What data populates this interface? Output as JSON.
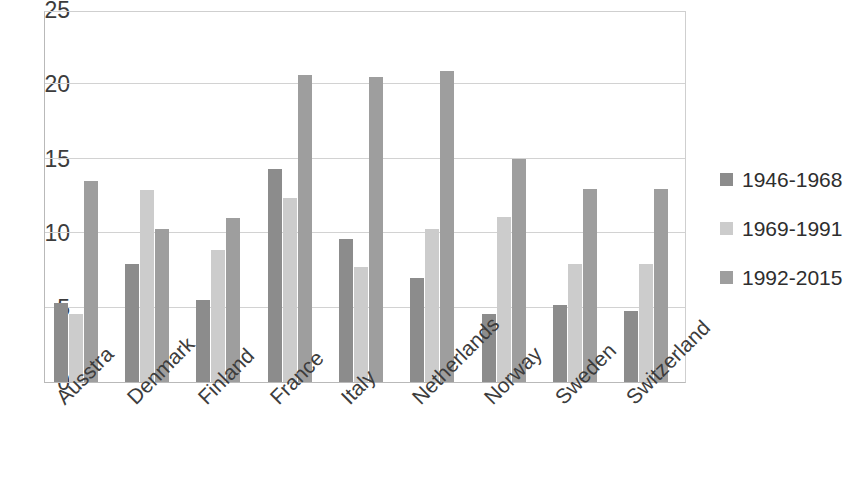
{
  "chart_data": {
    "type": "bar",
    "title": "",
    "subtitle": "",
    "xlabel": "",
    "ylabel": "",
    "ylim": [
      0,
      25
    ],
    "yticks": [
      0,
      5,
      10,
      15,
      20,
      25
    ],
    "ytick_labels": [
      "0",
      "5",
      "10",
      "15",
      "20",
      "25"
    ],
    "grid": true,
    "grid_axis": "y",
    "legend_position": "right",
    "bar_orientation": "vertical",
    "categories": [
      "Ausstra",
      "Denmark",
      "Finland",
      "France",
      "Italy",
      "Netherlands",
      "Norway",
      "Sweden",
      "Switzerland"
    ],
    "series": [
      {
        "name": "1946-1968",
        "color": "#8c8c8c",
        "values": [
          5.3,
          7.9,
          5.5,
          14.3,
          9.6,
          7.0,
          4.6,
          5.2,
          4.8
        ]
      },
      {
        "name": "1969-1991",
        "color": "#cccccc",
        "values": [
          4.6,
          12.9,
          8.9,
          12.4,
          7.7,
          10.3,
          11.1,
          7.9,
          7.9
        ]
      },
      {
        "name": "1992-2015",
        "color": "#9e9e9e",
        "values": [
          13.5,
          10.3,
          11.0,
          20.6,
          20.5,
          20.9,
          15.0,
          13.0,
          13.0
        ]
      }
    ]
  },
  "legend": {
    "items": [
      {
        "label": "1946-1968",
        "swatch_color": "#8c8c8c"
      },
      {
        "label": "1969-1991",
        "swatch_color": "#cccccc"
      },
      {
        "label": "1992-2015",
        "swatch_color": "#9e9e9e"
      }
    ]
  },
  "colors": {
    "background": "#ffffff",
    "axis": "#b9b9b9",
    "gridline": "#d2d2d2",
    "text": "#3c3c3c",
    "series_1946_1968": "#8c8c8c",
    "series_1969_1991": "#cccccc",
    "series_1992_2015": "#9e9e9e"
  }
}
